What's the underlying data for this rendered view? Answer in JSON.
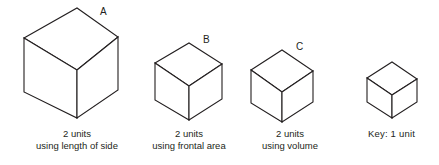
{
  "figure": {
    "background_color": "#ffffff",
    "line_color": "#231f20",
    "face_fill": "#ffffff"
  },
  "cubes": [
    {
      "id": "a",
      "label": "A",
      "caption_line1": "2 units",
      "caption_line2": "using length of side",
      "scale_note": "largest cube"
    },
    {
      "id": "b",
      "label": "B",
      "caption_line1": "2 units",
      "caption_line2": "using frontal area",
      "scale_note": "medium cube"
    },
    {
      "id": "c",
      "label": "C",
      "caption_line1": "2 units",
      "caption_line2": "using volume",
      "scale_note": "medium-small cube"
    },
    {
      "id": "key",
      "label": "",
      "caption_line1": "Key:  1 unit",
      "caption_line2": "",
      "scale_note": "smallest cube, unit reference"
    }
  ]
}
